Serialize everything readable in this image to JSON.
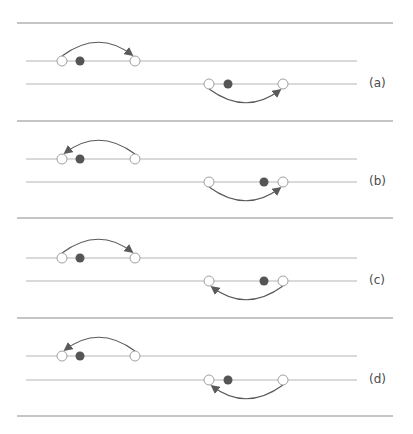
{
  "figure": {
    "width": 413,
    "height": 434,
    "colors": {
      "separator": "#8c8c8c",
      "track": "#b4b4b4",
      "arrow": "#5a5a5a",
      "dot": "#555555",
      "hollow_circle_stroke": "#a0a0a0",
      "label": "#4a4a4a"
    },
    "separators_y": [
      23,
      121,
      218,
      318,
      416
    ],
    "separator_x": [
      17,
      393
    ],
    "track_x": [
      26,
      357
    ]
  },
  "panels": [
    {
      "label": "(a)",
      "label_y": 84,
      "top_track": {
        "y": 61,
        "circles": [
          62,
          135
        ],
        "dot": 80,
        "arrow": {
          "from": 62,
          "to": 135,
          "direction": "right",
          "side": "above"
        }
      },
      "bottom_track": {
        "y": 84,
        "circles": [
          209,
          283
        ],
        "dot": 228,
        "arrow": {
          "from": 209,
          "to": 283,
          "direction": "right",
          "side": "below"
        }
      }
    },
    {
      "label": "(b)",
      "label_y": 182,
      "top_track": {
        "y": 159,
        "circles": [
          62,
          135
        ],
        "dot": 80,
        "arrow": {
          "from": 135,
          "to": 62,
          "direction": "left",
          "side": "above"
        }
      },
      "bottom_track": {
        "y": 182,
        "circles": [
          209,
          283
        ],
        "dot": 264,
        "arrow": {
          "from": 209,
          "to": 283,
          "direction": "right",
          "side": "below"
        }
      }
    },
    {
      "label": "(c)",
      "label_y": 281,
      "top_track": {
        "y": 258,
        "circles": [
          62,
          135
        ],
        "dot": 80,
        "arrow": {
          "from": 62,
          "to": 135,
          "direction": "right",
          "side": "above"
        }
      },
      "bottom_track": {
        "y": 281,
        "circles": [
          209,
          283
        ],
        "dot": 264,
        "arrow": {
          "from": 283,
          "to": 209,
          "direction": "left",
          "side": "below"
        }
      }
    },
    {
      "label": "(d)",
      "label_y": 380,
      "top_track": {
        "y": 356,
        "circles": [
          62,
          135
        ],
        "dot": 80,
        "arrow": {
          "from": 135,
          "to": 62,
          "direction": "left",
          "side": "above"
        }
      },
      "bottom_track": {
        "y": 380,
        "circles": [
          209,
          283
        ],
        "dot": 228,
        "arrow": {
          "from": 283,
          "to": 209,
          "direction": "left",
          "side": "below"
        }
      }
    }
  ]
}
